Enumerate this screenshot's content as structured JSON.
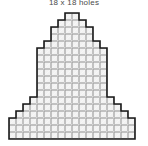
{
  "page": {
    "title": "18 x 18 holes",
    "background_color": "#ffffff"
  },
  "pattern": {
    "name": "stepped-pyramid",
    "grid_width_holes": 18,
    "grid_height_holes": 18,
    "cell_size_px": 7,
    "origin_x_px": 9,
    "origin_y_px": 7,
    "colors": {
      "cell_fill": "#f2f2f2",
      "cell_border": "#9a9a9a",
      "outline": "#1a1a1a",
      "title_text": "#4a4a4a"
    },
    "rows": [
      {
        "index": 0,
        "start_col": 8,
        "count": 2
      },
      {
        "index": 1,
        "start_col": 7,
        "count": 4
      },
      {
        "index": 2,
        "start_col": 6,
        "count": 6
      },
      {
        "index": 3,
        "start_col": 6,
        "count": 6
      },
      {
        "index": 4,
        "start_col": 5,
        "count": 8
      },
      {
        "index": 5,
        "start_col": 4,
        "count": 10
      },
      {
        "index": 6,
        "start_col": 4,
        "count": 10
      },
      {
        "index": 7,
        "start_col": 4,
        "count": 10
      },
      {
        "index": 8,
        "start_col": 4,
        "count": 10
      },
      {
        "index": 9,
        "start_col": 4,
        "count": 10
      },
      {
        "index": 10,
        "start_col": 4,
        "count": 10
      },
      {
        "index": 11,
        "start_col": 4,
        "count": 10
      },
      {
        "index": 12,
        "start_col": 3,
        "count": 12
      },
      {
        "index": 13,
        "start_col": 2,
        "count": 14
      },
      {
        "index": 14,
        "start_col": 1,
        "count": 16
      },
      {
        "index": 15,
        "start_col": 0,
        "count": 18
      },
      {
        "index": 16,
        "start_col": 0,
        "count": 18
      },
      {
        "index": 17,
        "start_col": 0,
        "count": 18
      }
    ]
  }
}
